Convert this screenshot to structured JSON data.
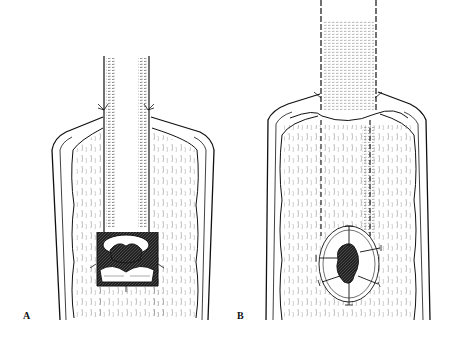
{
  "figure": {
    "panels": [
      {
        "label": "A",
        "description": "Tube inserted into opened organ; distal end with everted flaps sutured around the opening"
      },
      {
        "label": "B",
        "description": "Tube sutured along its length inside the opened organ; stoma with radial sutures near the distal end"
      }
    ],
    "colors": {
      "line": "#111111",
      "background": "#ffffff"
    }
  }
}
